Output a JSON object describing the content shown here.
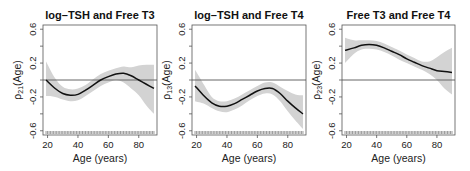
{
  "chart_data": [
    {
      "type": "line",
      "title": "log–TSH and Free T3",
      "xlabel": "Age (years)",
      "ylabel_main": "ρ",
      "ylabel_sub": "21",
      "ylabel_suffix": "(Age)",
      "xlim": [
        17,
        92
      ],
      "ylim": [
        -0.65,
        0.65
      ],
      "xticks": [
        20,
        40,
        60,
        80
      ],
      "xtick_labels": [
        "20",
        "40",
        "60",
        "80"
      ],
      "yticks": [
        -0.6,
        -0.4,
        -0.2,
        0.0,
        0.2,
        0.4,
        0.6
      ],
      "ytick_labels": [
        "-0.6",
        "",
        "-0.2",
        "",
        "0.2",
        "",
        "0.6"
      ],
      "reference_line": 0,
      "series": [
        {
          "name": "estimate",
          "x": [
            19,
            25,
            30,
            35,
            40,
            45,
            50,
            55,
            60,
            65,
            70,
            75,
            80,
            85,
            90
          ],
          "y": [
            0.0,
            -0.1,
            -0.16,
            -0.18,
            -0.17,
            -0.12,
            -0.06,
            0.0,
            0.04,
            0.07,
            0.08,
            0.05,
            0.0,
            -0.05,
            -0.1
          ],
          "lower": [
            -0.19,
            -0.2,
            -0.23,
            -0.25,
            -0.24,
            -0.19,
            -0.13,
            -0.07,
            -0.03,
            0.0,
            -0.03,
            -0.1,
            -0.18,
            -0.3,
            -0.4
          ],
          "upper": [
            0.22,
            0.02,
            -0.08,
            -0.11,
            -0.1,
            -0.06,
            0.01,
            0.07,
            0.11,
            0.14,
            0.16,
            0.15,
            0.17,
            0.18,
            0.18
          ]
        }
      ]
    },
    {
      "type": "line",
      "title": "log–TSH and Free T4",
      "xlabel": "Age (years)",
      "ylabel_main": "ρ",
      "ylabel_sub": "13",
      "ylabel_suffix": "(Age)",
      "xlim": [
        17,
        92
      ],
      "ylim": [
        -0.65,
        0.65
      ],
      "xticks": [
        20,
        40,
        60,
        80
      ],
      "xtick_labels": [
        "20",
        "40",
        "60",
        "80"
      ],
      "yticks": [
        -0.6,
        -0.4,
        -0.2,
        0.0,
        0.2,
        0.4,
        0.6
      ],
      "ytick_labels": [
        "-0.6",
        "",
        "-0.2",
        "",
        "0.2",
        "",
        "0.6"
      ],
      "reference_line": 0,
      "series": [
        {
          "name": "estimate",
          "x": [
            19,
            25,
            30,
            35,
            40,
            45,
            50,
            55,
            60,
            65,
            70,
            75,
            80,
            85,
            90
          ],
          "y": [
            -0.07,
            -0.19,
            -0.27,
            -0.31,
            -0.31,
            -0.28,
            -0.23,
            -0.18,
            -0.13,
            -0.1,
            -0.1,
            -0.16,
            -0.25,
            -0.33,
            -0.4
          ],
          "lower": [
            -0.25,
            -0.28,
            -0.33,
            -0.37,
            -0.38,
            -0.35,
            -0.3,
            -0.24,
            -0.19,
            -0.16,
            -0.17,
            -0.25,
            -0.37,
            -0.48,
            -0.58
          ],
          "upper": [
            0.12,
            -0.06,
            -0.2,
            -0.25,
            -0.25,
            -0.22,
            -0.17,
            -0.12,
            -0.07,
            -0.03,
            -0.03,
            -0.08,
            -0.13,
            -0.17,
            -0.18
          ]
        }
      ]
    },
    {
      "type": "line",
      "title": "Free T3 and Free T4",
      "xlabel": "Age (years)",
      "ylabel_main": "ρ",
      "ylabel_sub": "23",
      "ylabel_suffix": "(Age)",
      "xlim": [
        17,
        92
      ],
      "ylim": [
        -0.65,
        0.65
      ],
      "xticks": [
        20,
        40,
        60,
        80
      ],
      "xtick_labels": [
        "20",
        "40",
        "60",
        "80"
      ],
      "yticks": [
        -0.6,
        -0.4,
        -0.2,
        0.0,
        0.2,
        0.4,
        0.6
      ],
      "ytick_labels": [
        "-0.6",
        "",
        "-0.2",
        "",
        "0.2",
        "",
        "0.6"
      ],
      "reference_line": 0,
      "series": [
        {
          "name": "estimate",
          "x": [
            19,
            25,
            30,
            35,
            40,
            45,
            50,
            55,
            60,
            65,
            70,
            75,
            80,
            85,
            90
          ],
          "y": [
            0.35,
            0.38,
            0.41,
            0.42,
            0.41,
            0.38,
            0.34,
            0.3,
            0.25,
            0.21,
            0.17,
            0.14,
            0.11,
            0.1,
            0.09
          ],
          "lower": [
            0.2,
            0.31,
            0.36,
            0.37,
            0.36,
            0.33,
            0.29,
            0.24,
            0.2,
            0.16,
            0.12,
            0.07,
            0.0,
            -0.1,
            -0.17
          ],
          "upper": [
            0.5,
            0.47,
            0.47,
            0.47,
            0.46,
            0.43,
            0.39,
            0.35,
            0.3,
            0.26,
            0.22,
            0.22,
            0.27,
            0.33,
            0.38
          ]
        }
      ]
    }
  ]
}
